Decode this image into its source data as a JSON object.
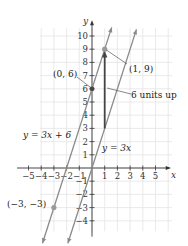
{
  "chart_data": {
    "type": "line",
    "title": "",
    "xlabel": "x",
    "ylabel": "y",
    "xlim": [
      -6,
      6
    ],
    "ylim": [
      -5,
      11
    ],
    "grid": true,
    "x_ticks": [
      -5,
      -4,
      -3,
      -2,
      -1,
      1,
      2,
      3,
      4,
      5
    ],
    "y_ticks": [
      -4,
      -3,
      -2,
      -1,
      1,
      2,
      3,
      4,
      5,
      6,
      7,
      8,
      9,
      10
    ],
    "x_tick_labels": [
      "−5",
      "−4",
      "−3",
      "−2",
      "−1",
      "1",
      "2",
      "3",
      "4",
      "5"
    ],
    "y_tick_labels": [
      "−4",
      "−3",
      "−2",
      "−1",
      "1",
      "2",
      "3",
      "4",
      "5",
      "6",
      "7",
      "8",
      "9",
      "10"
    ],
    "series": [
      {
        "name": "y = 3x + 6",
        "slope": 3,
        "intercept": 6,
        "x_range": [
          -3.9,
          1.55
        ]
      },
      {
        "name": "y = 3x",
        "slope": 3,
        "intercept": 0,
        "x_range": [
          -1.9,
          3.5
        ]
      }
    ],
    "points": [
      {
        "label": "(0, 6)",
        "x": 0,
        "y": 6
      },
      {
        "label": "(1, 9)",
        "x": 1,
        "y": 9
      },
      {
        "label": "(−3, −3)",
        "x": -3,
        "y": -3
      }
    ],
    "annotations": [
      {
        "text": "6 units up",
        "arrow_from": [
          1,
          3
        ],
        "arrow_to": [
          1,
          9
        ]
      }
    ]
  },
  "labels": {
    "x_axis": "x",
    "y_axis": "y",
    "line1": "y = 3x + 6",
    "line2": "y = 3x",
    "point_06": "(0, 6)",
    "point_19": "(1, 9)",
    "point_m3m3": "(−3, −3)",
    "shift": "6 units up"
  },
  "colors": {
    "lines": "#8a8a8a",
    "axes": "#333333",
    "grid": "#e4e4e4",
    "shift_arrow": "#444444",
    "points": "#9a9a9a"
  }
}
